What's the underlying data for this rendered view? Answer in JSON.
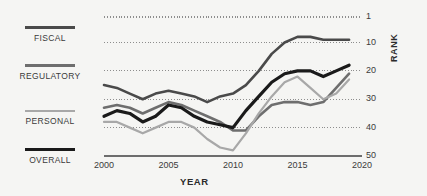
{
  "legend": {
    "items": [
      {
        "label": "FISCAL",
        "color": "#4a4a4a",
        "width": 2.6,
        "key": "fiscal"
      },
      {
        "label": "REGULATORY",
        "color": "#6e6e6e",
        "width": 2.6,
        "key": "regulatory"
      },
      {
        "label": "PERSONAL",
        "color": "#a8a8a8",
        "width": 2.2,
        "key": "personal"
      },
      {
        "label": "OVERALL",
        "color": "#1a1a1a",
        "width": 3.2,
        "key": "overall"
      }
    ]
  },
  "axes": {
    "y_title": "RANK",
    "x_title": "YEAR",
    "y_ticks": [
      "1",
      "10",
      "20",
      "30",
      "40",
      "50"
    ],
    "x_ticks": [
      "2000",
      "2005",
      "2010",
      "2015",
      "2020"
    ]
  },
  "chart_data": {
    "type": "line",
    "title": "",
    "xlabel": "YEAR",
    "ylabel": "RANK",
    "x": [
      2000,
      2001,
      2002,
      2003,
      2004,
      2005,
      2006,
      2007,
      2008,
      2009,
      2010,
      2011,
      2012,
      2013,
      2014,
      2015,
      2016,
      2017,
      2018,
      2019
    ],
    "xlim": [
      2000,
      2020
    ],
    "ylim": [
      1,
      50
    ],
    "y_inverted": true,
    "y_ticks": [
      1,
      10,
      20,
      30,
      40,
      50
    ],
    "x_ticks": [
      2000,
      2005,
      2010,
      2015,
      2020
    ],
    "grid": "horizontal-dotted",
    "legend_position": "left",
    "series": [
      {
        "name": "FISCAL",
        "color": "#4a4a4a",
        "linewidth": 2.6,
        "values": [
          25,
          26,
          28,
          30,
          28,
          27,
          28,
          29,
          31,
          29,
          28,
          25,
          20,
          14,
          10,
          8,
          8,
          9,
          9,
          9
        ]
      },
      {
        "name": "REGULATORY",
        "color": "#6e6e6e",
        "linewidth": 2.6,
        "values": [
          33,
          32,
          33,
          35,
          33,
          31,
          32,
          34,
          36,
          38,
          41,
          41,
          36,
          32,
          31,
          31,
          32,
          31,
          26,
          21
        ]
      },
      {
        "name": "PERSONAL",
        "color": "#a8a8a8",
        "linewidth": 2.2,
        "values": [
          38,
          38,
          40,
          42,
          40,
          38,
          38,
          40,
          44,
          47,
          48,
          42,
          35,
          29,
          24,
          22,
          26,
          30,
          28,
          23
        ]
      },
      {
        "name": "OVERALL",
        "color": "#1a1a1a",
        "linewidth": 3.2,
        "values": [
          36,
          34,
          35,
          38,
          36,
          32,
          33,
          36,
          38,
          39,
          40,
          34,
          29,
          24,
          21,
          20,
          20,
          22,
          20,
          18
        ]
      }
    ]
  }
}
